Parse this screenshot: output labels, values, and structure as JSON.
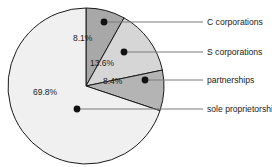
{
  "chart_data": {
    "type": "pie",
    "title": "",
    "subtitle": "",
    "xlabel": "",
    "ylabel": "",
    "legend_position": "right-callout",
    "grid": false,
    "value_suffix": "%",
    "start_angle_deg": 0,
    "direction": "clockwise",
    "categories": [
      "C corporations",
      "S corporations",
      "partnerships",
      "sole proprietorships"
    ],
    "values": [
      8.1,
      13.6,
      8.4,
      69.8
    ],
    "value_labels": [
      "8.1%",
      "13.6%",
      "8.4%",
      "69.8%"
    ],
    "colors": [
      "#a8a8a8",
      "#d6d6d6",
      "#b4b4b4",
      "#f0f0f0"
    ],
    "slices": [
      {
        "label": "C corporations",
        "value": 8.1,
        "value_label": "8.1%",
        "color": "#a8a8a8",
        "value_label_x": 73,
        "value_label_y": 41,
        "dot_x": 104,
        "dot_y": 22,
        "leader_end_x": 203,
        "legend_x": 207,
        "legend_y": 18
      },
      {
        "label": "S corporations",
        "value": 13.6,
        "value_label": "13.6%",
        "color": "#d6d6d6",
        "value_label_x": 90,
        "value_label_y": 66,
        "dot_x": 124,
        "dot_y": 52,
        "leader_end_x": 203,
        "legend_x": 207,
        "legend_y": 48
      },
      {
        "label": "partnerships",
        "value": 8.4,
        "value_label": "8.4%",
        "color": "#b4b4b4",
        "value_label_x": 103,
        "value_label_y": 84,
        "dot_x": 145,
        "dot_y": 80,
        "leader_end_x": 203,
        "legend_x": 207,
        "legend_y": 76
      },
      {
        "label": "sole proprietorships",
        "value": 69.8,
        "value_label": "69.8%",
        "color": "#f0f0f0",
        "value_label_x": 33,
        "value_label_y": 95,
        "dot_x": 77,
        "dot_y": 109,
        "leader_end_x": 203,
        "legend_x": 207,
        "legend_y": 105
      }
    ],
    "geometry": {
      "center_x": 86,
      "center_y": 86,
      "radius": 78
    }
  }
}
